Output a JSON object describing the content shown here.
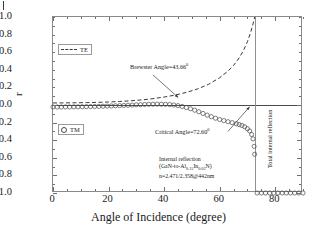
{
  "chart_data": {
    "type": "line",
    "title": "",
    "xlabel": "Angle of Incidence (degree)",
    "ylabel": "r",
    "xlim": [
      0,
      90
    ],
    "ylim": [
      -1.0,
      1.0
    ],
    "xticks": [
      0,
      20,
      40,
      60,
      80
    ],
    "yticks": [
      1.0,
      0.8,
      0.6,
      0.4,
      0.2,
      0.0,
      -0.2,
      -0.4,
      -0.6,
      -0.8,
      -1.0
    ],
    "xticklabels": [
      "0",
      "20",
      "40",
      "60",
      "80"
    ],
    "yticklabels": [
      "1.0",
      "0.8",
      "0.6",
      "0.4",
      "0.2",
      "0.0",
      "-0.2",
      "-0.4",
      "-0.6",
      "-0.8",
      "-1.0"
    ],
    "grid": false,
    "legend_entries": [
      {
        "name": "TE",
        "style": "dashed-line"
      },
      {
        "name": "TM",
        "style": "open-circle"
      }
    ],
    "series": [
      {
        "name": "TE",
        "style": "dashed",
        "x": [
          0,
          4,
          8,
          12,
          16,
          20,
          24,
          28,
          32,
          36,
          40,
          44,
          48,
          52,
          56,
          60,
          63,
          65,
          67,
          68.5,
          70,
          71,
          71.8,
          72.2,
          72.45,
          72.6
        ],
        "y": [
          0.023,
          0.024,
          0.025,
          0.027,
          0.03,
          0.034,
          0.04,
          0.048,
          0.058,
          0.072,
          0.09,
          0.113,
          0.143,
          0.182,
          0.235,
          0.31,
          0.385,
          0.45,
          0.535,
          0.615,
          0.72,
          0.81,
          0.895,
          0.945,
          0.975,
          1.0
        ]
      },
      {
        "name": "TM",
        "style": "open-circles",
        "x": [
          0,
          1.5,
          3,
          4.5,
          6,
          7.5,
          9,
          10.5,
          12,
          13.5,
          15,
          16.5,
          18,
          19.5,
          21,
          22.5,
          24,
          25.5,
          27,
          28.5,
          30,
          31.5,
          33,
          34.5,
          36,
          37.5,
          39,
          40.5,
          42,
          43.5,
          45,
          46.5,
          48,
          49.5,
          51,
          52.5,
          54,
          55.5,
          57,
          58.5,
          60,
          61.5,
          63,
          64.5,
          66,
          67,
          68,
          69,
          70,
          70.8,
          71.5,
          72,
          72.4,
          72.6,
          73.5,
          75,
          76.5,
          78,
          79.5,
          81,
          82.5,
          84,
          85.5,
          87,
          88.5,
          90
        ],
        "y": [
          -0.023,
          -0.023,
          -0.023,
          -0.022,
          -0.022,
          -0.021,
          -0.021,
          -0.02,
          -0.019,
          -0.018,
          -0.017,
          -0.016,
          -0.014,
          -0.013,
          -0.011,
          -0.009,
          -0.007,
          -0.005,
          -0.003,
          -0.001,
          0.002,
          0.004,
          0.006,
          0.008,
          0.009,
          0.01,
          0.009,
          0.008,
          0.005,
          0.0,
          -0.007,
          -0.017,
          -0.029,
          -0.043,
          -0.059,
          -0.077,
          -0.096,
          -0.115,
          -0.133,
          -0.15,
          -0.165,
          -0.177,
          -0.19,
          -0.2,
          -0.213,
          -0.222,
          -0.233,
          -0.248,
          -0.27,
          -0.295,
          -0.335,
          -0.385,
          -0.47,
          -0.56,
          -1.0,
          -1.0,
          -1.0,
          -1.0,
          -1.0,
          -1.0,
          -1.0,
          -1.0,
          -1.0,
          -1.0,
          -1.0,
          -1.0
        ]
      }
    ],
    "reference_lines": [
      {
        "name": "zero-line",
        "orientation": "horizontal",
        "value": 0.0
      },
      {
        "name": "critical-angle-line",
        "orientation": "vertical",
        "value": 72.6
      }
    ],
    "annotations": [
      {
        "name": "brewster-angle",
        "text": "Brewster Angle=43.66",
        "sup": "0",
        "x": 43.66
      },
      {
        "name": "critical-angle",
        "text": "Critical Angle=72.60",
        "sup": "0",
        "x": 72.6
      },
      {
        "name": "total-internal-reflection",
        "text": "Total internal reflection"
      },
      {
        "name": "material-note",
        "line1": "Internal reflection",
        "line2a": "(GaN-to-Al",
        "sub1": "0.15",
        "line2b": "In",
        "sub2": "0.02",
        "line2c": "N)",
        "line3": "n=2.471/2.358@442nm"
      }
    ]
  },
  "axis": {
    "y_title": "r",
    "x_title": "Angle of Incidence (degree)"
  },
  "legend": {
    "te_label": "TE",
    "tm_label": "TM"
  },
  "colors": {
    "line": "#3a3a3a",
    "marker": "#4a4a4a",
    "frame": "#8a8a8a",
    "text": "#1a1a1a"
  }
}
